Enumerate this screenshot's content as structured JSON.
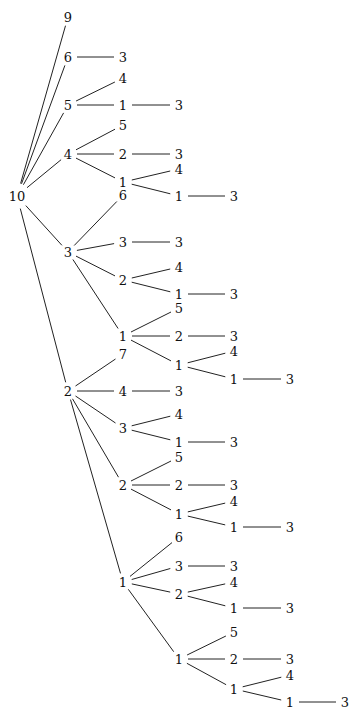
{
  "diagram": {
    "type": "tree",
    "orientation": "left-to-right",
    "root": "10",
    "nodes": [
      {
        "id": "n0",
        "label": "10",
        "x": 17,
        "y": 196
      },
      {
        "id": "a9",
        "label": "9",
        "x": 68,
        "y": 17
      },
      {
        "id": "a6",
        "label": "6",
        "x": 68,
        "y": 57
      },
      {
        "id": "a6c3",
        "label": "3",
        "x": 123,
        "y": 57
      },
      {
        "id": "a5",
        "label": "5",
        "x": 68,
        "y": 105
      },
      {
        "id": "a5c4",
        "label": "4",
        "x": 123,
        "y": 78
      },
      {
        "id": "a5c1",
        "label": "1",
        "x": 123,
        "y": 105
      },
      {
        "id": "a5c1c3",
        "label": "3",
        "x": 179,
        "y": 105
      },
      {
        "id": "a4",
        "label": "4",
        "x": 68,
        "y": 154
      },
      {
        "id": "a4c5",
        "label": "5",
        "x": 123,
        "y": 125
      },
      {
        "id": "a4c2",
        "label": "2",
        "x": 123,
        "y": 154
      },
      {
        "id": "a4c2c3",
        "label": "3",
        "x": 179,
        "y": 154
      },
      {
        "id": "a4c1",
        "label": "1",
        "x": 123,
        "y": 182
      },
      {
        "id": "a4c1c4",
        "label": "4",
        "x": 179,
        "y": 169
      },
      {
        "id": "a4c1c1",
        "label": "1",
        "x": 179,
        "y": 196
      },
      {
        "id": "a4c1c1c3",
        "label": "3",
        "x": 234,
        "y": 196
      },
      {
        "id": "a3",
        "label": "3",
        "x": 68,
        "y": 252
      },
      {
        "id": "a3c6",
        "label": "6",
        "x": 123,
        "y": 195
      },
      {
        "id": "a3c3",
        "label": "3",
        "x": 123,
        "y": 242
      },
      {
        "id": "a3c3c3",
        "label": "3",
        "x": 179,
        "y": 242
      },
      {
        "id": "a3c2",
        "label": "2",
        "x": 123,
        "y": 280
      },
      {
        "id": "a3c2c4",
        "label": "4",
        "x": 179,
        "y": 267
      },
      {
        "id": "a3c2c1",
        "label": "1",
        "x": 179,
        "y": 294
      },
      {
        "id": "a3c2c1c3",
        "label": "3",
        "x": 234,
        "y": 294
      },
      {
        "id": "a3c1",
        "label": "1",
        "x": 123,
        "y": 336
      },
      {
        "id": "a3c1c5",
        "label": "5",
        "x": 179,
        "y": 308
      },
      {
        "id": "a3c1c2",
        "label": "2",
        "x": 179,
        "y": 336
      },
      {
        "id": "a3c1c2c3",
        "label": "3",
        "x": 234,
        "y": 336
      },
      {
        "id": "a3c1c1",
        "label": "1",
        "x": 179,
        "y": 365
      },
      {
        "id": "a3c1c1c4",
        "label": "4",
        "x": 234,
        "y": 351
      },
      {
        "id": "a3c1c1c1",
        "label": "1",
        "x": 234,
        "y": 379
      },
      {
        "id": "a3c1c1c1c3",
        "label": "3",
        "x": 290,
        "y": 379
      },
      {
        "id": "a2",
        "label": "2",
        "x": 68,
        "y": 391
      },
      {
        "id": "a2c7",
        "label": "7",
        "x": 123,
        "y": 354
      },
      {
        "id": "a2c4",
        "label": "4",
        "x": 123,
        "y": 391
      },
      {
        "id": "a2c4c3",
        "label": "3",
        "x": 179,
        "y": 391
      },
      {
        "id": "a2c3",
        "label": "3",
        "x": 123,
        "y": 428
      },
      {
        "id": "a2c3c4",
        "label": "4",
        "x": 179,
        "y": 414
      },
      {
        "id": "a2c3c1",
        "label": "1",
        "x": 179,
        "y": 442
      },
      {
        "id": "a2c3c1c3",
        "label": "3",
        "x": 234,
        "y": 442
      },
      {
        "id": "a2c2",
        "label": "2",
        "x": 123,
        "y": 485
      },
      {
        "id": "a2c2c5",
        "label": "5",
        "x": 179,
        "y": 457
      },
      {
        "id": "a2c2c2",
        "label": "2",
        "x": 179,
        "y": 485
      },
      {
        "id": "a2c2c2c3",
        "label": "3",
        "x": 234,
        "y": 485
      },
      {
        "id": "a2c2c1",
        "label": "1",
        "x": 179,
        "y": 514
      },
      {
        "id": "a2c2c1c4",
        "label": "4",
        "x": 234,
        "y": 501
      },
      {
        "id": "a2c2c1c1",
        "label": "1",
        "x": 234,
        "y": 527
      },
      {
        "id": "a2c2c1c1c3",
        "label": "3",
        "x": 290,
        "y": 527
      },
      {
        "id": "a2c1",
        "label": "1",
        "x": 123,
        "y": 582
      },
      {
        "id": "a2c1c6",
        "label": "6",
        "x": 179,
        "y": 537
      },
      {
        "id": "a2c1c3",
        "label": "3",
        "x": 179,
        "y": 566
      },
      {
        "id": "a2c1c3c3",
        "label": "3",
        "x": 234,
        "y": 566
      },
      {
        "id": "a2c1c2",
        "label": "2",
        "x": 179,
        "y": 594
      },
      {
        "id": "a2c1c2c4",
        "label": "4",
        "x": 234,
        "y": 582
      },
      {
        "id": "a2c1c2c1",
        "label": "1",
        "x": 234,
        "y": 608
      },
      {
        "id": "a2c1c2c1c3",
        "label": "3",
        "x": 290,
        "y": 608
      },
      {
        "id": "a2c1c1",
        "label": "1",
        "x": 179,
        "y": 659
      },
      {
        "id": "a2c1c1c5",
        "label": "5",
        "x": 234,
        "y": 632
      },
      {
        "id": "a2c1c1c2",
        "label": "2",
        "x": 234,
        "y": 659
      },
      {
        "id": "a2c1c1c2c3",
        "label": "3",
        "x": 290,
        "y": 659
      },
      {
        "id": "a2c1c1c1",
        "label": "1",
        "x": 234,
        "y": 689
      },
      {
        "id": "a2c1c1c1c4",
        "label": "4",
        "x": 290,
        "y": 675
      },
      {
        "id": "a2c1c1c1c1",
        "label": "1",
        "x": 290,
        "y": 702
      },
      {
        "id": "a2c1c1c1c1c3",
        "label": "3",
        "x": 345,
        "y": 702
      }
    ],
    "edges": [
      [
        "n0",
        "a9"
      ],
      [
        "n0",
        "a6"
      ],
      [
        "n0",
        "a5"
      ],
      [
        "n0",
        "a4"
      ],
      [
        "n0",
        "a3"
      ],
      [
        "n0",
        "a2"
      ],
      [
        "a6",
        "a6c3"
      ],
      [
        "a5",
        "a5c4"
      ],
      [
        "a5",
        "a5c1"
      ],
      [
        "a5c1",
        "a5c1c3"
      ],
      [
        "a4",
        "a4c5"
      ],
      [
        "a4",
        "a4c2"
      ],
      [
        "a4c2",
        "a4c2c3"
      ],
      [
        "a4",
        "a4c1"
      ],
      [
        "a4c1",
        "a4c1c4"
      ],
      [
        "a4c1",
        "a4c1c1"
      ],
      [
        "a4c1c1",
        "a4c1c1c3"
      ],
      [
        "a3",
        "a3c6"
      ],
      [
        "a3",
        "a3c3"
      ],
      [
        "a3c3",
        "a3c3c3"
      ],
      [
        "a3",
        "a3c2"
      ],
      [
        "a3c2",
        "a3c2c4"
      ],
      [
        "a3c2",
        "a3c2c1"
      ],
      [
        "a3c2c1",
        "a3c2c1c3"
      ],
      [
        "a3",
        "a3c1"
      ],
      [
        "a3c1",
        "a3c1c5"
      ],
      [
        "a3c1",
        "a3c1c2"
      ],
      [
        "a3c1c2",
        "a3c1c2c3"
      ],
      [
        "a3c1",
        "a3c1c1"
      ],
      [
        "a3c1c1",
        "a3c1c1c4"
      ],
      [
        "a3c1c1",
        "a3c1c1c1"
      ],
      [
        "a3c1c1c1",
        "a3c1c1c1c3"
      ],
      [
        "a2",
        "a2c7"
      ],
      [
        "a2",
        "a2c4"
      ],
      [
        "a2c4",
        "a2c4c3"
      ],
      [
        "a2",
        "a2c3"
      ],
      [
        "a2c3",
        "a2c3c4"
      ],
      [
        "a2c3",
        "a2c3c1"
      ],
      [
        "a2c3c1",
        "a2c3c1c3"
      ],
      [
        "a2",
        "a2c2"
      ],
      [
        "a2c2",
        "a2c2c5"
      ],
      [
        "a2c2",
        "a2c2c2"
      ],
      [
        "a2c2c2",
        "a2c2c2c3"
      ],
      [
        "a2c2",
        "a2c2c1"
      ],
      [
        "a2c2c1",
        "a2c2c1c4"
      ],
      [
        "a2c2c1",
        "a2c2c1c1"
      ],
      [
        "a2c2c1c1",
        "a2c2c1c1c3"
      ],
      [
        "a2",
        "a2c1"
      ],
      [
        "a2c1",
        "a2c1c6"
      ],
      [
        "a2c1",
        "a2c1c3"
      ],
      [
        "a2c1c3",
        "a2c1c3c3"
      ],
      [
        "a2c1",
        "a2c1c2"
      ],
      [
        "a2c1c2",
        "a2c1c2c4"
      ],
      [
        "a2c1c2",
        "a2c1c2c1"
      ],
      [
        "a2c1c2c1",
        "a2c1c2c1c3"
      ],
      [
        "a2c1",
        "a2c1c1"
      ],
      [
        "a2c1c1",
        "a2c1c1c5"
      ],
      [
        "a2c1c1",
        "a2c1c1c2"
      ],
      [
        "a2c1c1c2",
        "a2c1c1c2c3"
      ],
      [
        "a2c1c1",
        "a2c1c1c1"
      ],
      [
        "a2c1c1c1",
        "a2c1c1c1c4"
      ],
      [
        "a2c1c1c1",
        "a2c1c1c1c1"
      ],
      [
        "a2c1c1c1c1",
        "a2c1c1c1c1c3"
      ]
    ]
  }
}
